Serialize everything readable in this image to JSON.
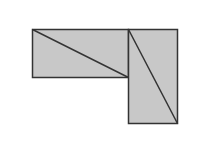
{
  "diagram": {
    "canvas": {
      "width": 218,
      "height": 165,
      "background": "#ffffff"
    },
    "colors": {
      "fill": "#c8c8c8",
      "stroke": "#333333"
    },
    "shapes": [
      {
        "name": "horizontal-rectangle",
        "x": 32,
        "y": 29,
        "width": 96,
        "height": 48,
        "diagonal": {
          "x1": 32,
          "y1": 29,
          "x2": 128,
          "y2": 77
        }
      },
      {
        "name": "vertical-rectangle",
        "x": 128,
        "y": 29,
        "width": 49,
        "height": 94,
        "diagonal": {
          "x1": 128,
          "y1": 29,
          "x2": 177,
          "y2": 123
        }
      }
    ]
  }
}
